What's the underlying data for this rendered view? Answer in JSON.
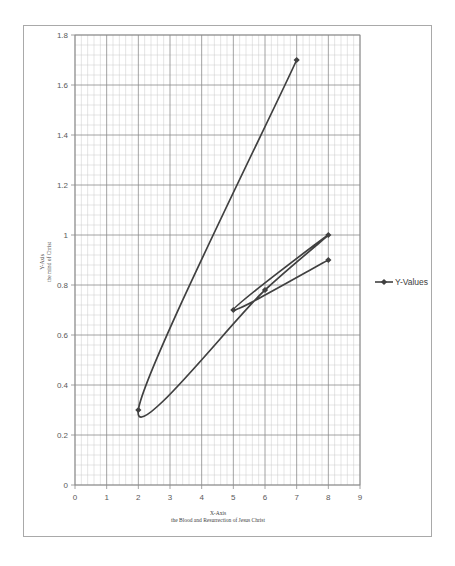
{
  "chart_data": {
    "type": "scatter",
    "subtype": "scatter-with-smooth-lines-and-markers",
    "title": "",
    "xlabel": "X-Axis",
    "xlabel_sub": "the Blood and Resurrection of Jesus Christ",
    "ylabel": "Y-Axis",
    "ylabel_sub": "the mind of Christ",
    "xlim": [
      0,
      9
    ],
    "ylim": [
      0,
      1.8
    ],
    "x_ticks": [
      "0",
      "1",
      "2",
      "3",
      "4",
      "5",
      "6",
      "7",
      "8",
      "9"
    ],
    "y_ticks": [
      "0",
      "0.2",
      "0.4",
      "0.6",
      "0.8",
      "1",
      "1.2",
      "1.4",
      "1.6",
      "1.8"
    ],
    "grid": {
      "major": true,
      "minor": true,
      "x_minor_per_major": 5,
      "y_minor_per_major": 5
    },
    "legend": {
      "position": "right",
      "entries": [
        "Y-Values"
      ]
    },
    "series": [
      {
        "name": "Y-Values",
        "color": "#404040",
        "points": [
          {
            "x": 7,
            "y": 1.7
          },
          {
            "x": 2,
            "y": 0.3
          },
          {
            "x": 6,
            "y": 0.78
          },
          {
            "x": 8,
            "y": 1.0
          },
          {
            "x": 5,
            "y": 0.7
          },
          {
            "x": 8,
            "y": 0.9
          }
        ]
      }
    ]
  },
  "colors": {
    "frame": "#a9a9a9",
    "grid_major": "#8c8c8c",
    "grid_minor": "#c8c8c8",
    "series": "#404040",
    "text": "#595959"
  }
}
